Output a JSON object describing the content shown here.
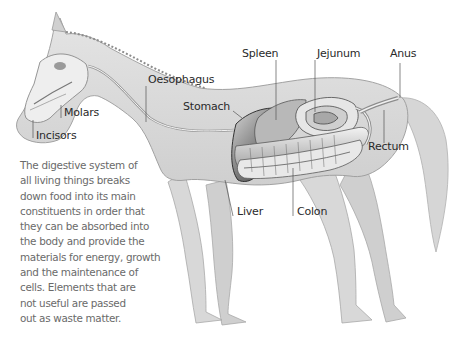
{
  "diagram": {
    "labels": {
      "spleen": "Spleen",
      "jejunum": "Jejunum",
      "anus": "Anus",
      "oesophagus": "Oesophagus",
      "stomach": "Stomach",
      "molars": "Molars",
      "incisors": "Incisors",
      "rectum": "Rectum",
      "liver": "Liver",
      "colon": "Colon"
    },
    "caption": {
      "lines": [
        "The digestive system of",
        "all living things breaks",
        "down food into its main",
        "constituents in order that",
        "they can be absorbed into",
        "the body and provide the",
        "materials for energy, growth",
        "and the maintenance of",
        "cells. Elements that are",
        "not useful are passed",
        "out as waste matter."
      ]
    },
    "colors": {
      "body": "#dcdcdc",
      "outline": "#9a9a9a",
      "organ_dark": "#3a3a3a",
      "organ_mid": "#8a8a8a",
      "organ_light": "#f0f0f0",
      "label_text": "#2a2a2a",
      "caption_text": "#6a6a6a",
      "leader_line": "#555555"
    }
  }
}
